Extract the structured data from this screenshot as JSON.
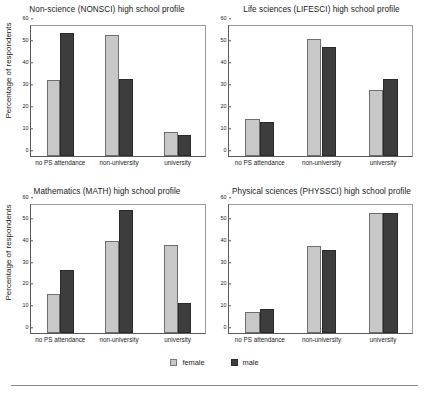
{
  "figure": {
    "legend": {
      "entries": [
        {
          "label": "female",
          "color": "#c8c8c8",
          "swatch": "legend-swatch-female"
        },
        {
          "label": "male",
          "color": "#3d3d3d",
          "swatch": "legend-swatch-male"
        }
      ]
    },
    "shared": {
      "ylabel": "Percentage of respondents",
      "categories": [
        "no PS attendance",
        "non-university",
        "university"
      ],
      "yticks": [
        0,
        10,
        20,
        30,
        40,
        50,
        60
      ],
      "ylim": [
        0,
        60
      ]
    }
  },
  "chart_data": [
    {
      "type": "bar",
      "title": "Non-science (NONSCI) high school profile",
      "xlabel": "",
      "ylabel": "Percentage of respondents",
      "ylim": [
        0,
        60
      ],
      "yticks": [
        0,
        10,
        20,
        30,
        40,
        50,
        60
      ],
      "grid": false,
      "legend_position": "below-figure",
      "categories": [
        "no PS attendance",
        "non-university",
        "university"
      ],
      "series": [
        {
          "name": "female",
          "color": "#c8c8c8",
          "values": [
            34.5,
            55,
            11
          ]
        },
        {
          "name": "male",
          "color": "#3d3d3d",
          "values": [
            56,
            35,
            9.5
          ]
        }
      ]
    },
    {
      "type": "bar",
      "title": "Life sciences (LIFESCI) high school profile",
      "xlabel": "",
      "ylabel": "",
      "ylim": [
        0,
        60
      ],
      "yticks": [
        0,
        10,
        20,
        30,
        40,
        50,
        60
      ],
      "grid": false,
      "legend_position": "below-figure",
      "categories": [
        "no PS attendance",
        "non-university",
        "university"
      ],
      "series": [
        {
          "name": "female",
          "color": "#c8c8c8",
          "values": [
            17,
            53,
            30
          ]
        },
        {
          "name": "male",
          "color": "#3d3d3d",
          "values": [
            15.5,
            49.5,
            35
          ]
        }
      ]
    },
    {
      "type": "bar",
      "title": "Mathematics (MATH) high school profile",
      "xlabel": "",
      "ylabel": "Percentage of respondents",
      "ylim": [
        0,
        60
      ],
      "yticks": [
        0,
        10,
        20,
        30,
        40,
        50,
        60
      ],
      "grid": false,
      "legend_position": "below-figure",
      "categories": [
        "no PS attendance",
        "non-university",
        "university"
      ],
      "series": [
        {
          "name": "female",
          "color": "#c8c8c8",
          "values": [
            18,
            42.5,
            40.5
          ]
        },
        {
          "name": "male",
          "color": "#3d3d3d",
          "values": [
            29,
            57,
            14
          ]
        }
      ]
    },
    {
      "type": "bar",
      "title": "Physical sciences (PHYSSCI) high school profile",
      "xlabel": "",
      "ylabel": "",
      "ylim": [
        0,
        60
      ],
      "yticks": [
        0,
        10,
        20,
        30,
        40,
        50,
        60
      ],
      "grid": false,
      "legend_position": "below-figure",
      "categories": [
        "no PS attendance",
        "non-university",
        "university"
      ],
      "series": [
        {
          "name": "female",
          "color": "#c8c8c8",
          "values": [
            9.8,
            40.2,
            55.2
          ]
        },
        {
          "name": "male",
          "color": "#3d3d3d",
          "values": [
            11.3,
            38.3,
            55.5
          ]
        }
      ]
    }
  ]
}
